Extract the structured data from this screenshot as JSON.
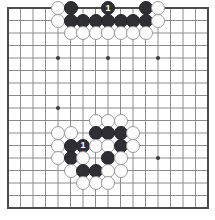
{
  "diagram": {
    "kind": "go-board-diagram",
    "board": {
      "size": 17,
      "lines": 17,
      "origin_x": 8,
      "origin_y": 8,
      "spacing": 12.5,
      "background_color": "#ffffff",
      "line_color": "#8c8c8c",
      "border_color": "#4a4a4a",
      "border_width": 2,
      "line_width": 1,
      "star_point_color": "#3a3a3a",
      "star_point_radius": 2,
      "star_points": [
        {
          "col": 4,
          "row": 4
        },
        {
          "col": 8,
          "row": 4
        },
        {
          "col": 12,
          "row": 4
        },
        {
          "col": 4,
          "row": 8
        },
        {
          "col": 12,
          "row": 12
        }
      ]
    },
    "stone_style": {
      "radius": 7,
      "black_fill": "#2f2f33",
      "black_edge": "#242427",
      "white_fill": "#fdfdfd",
      "white_edge": "#9a9a9a",
      "black_label_color": "#ffffff"
    },
    "stones": [
      {
        "col": 4,
        "row": 0,
        "color": "white",
        "label": ""
      },
      {
        "col": 5,
        "row": 0,
        "color": "black",
        "label": ""
      },
      {
        "col": 8,
        "row": 0,
        "color": "black",
        "label": "1"
      },
      {
        "col": 11,
        "row": 0,
        "color": "black",
        "label": ""
      },
      {
        "col": 12,
        "row": 0,
        "color": "white",
        "label": ""
      },
      {
        "col": 4,
        "row": 1,
        "color": "white",
        "label": ""
      },
      {
        "col": 5,
        "row": 1,
        "color": "black",
        "label": ""
      },
      {
        "col": 6,
        "row": 1,
        "color": "black",
        "label": ""
      },
      {
        "col": 7,
        "row": 1,
        "color": "black",
        "label": ""
      },
      {
        "col": 8,
        "row": 1,
        "color": "black",
        "label": ""
      },
      {
        "col": 9,
        "row": 1,
        "color": "black",
        "label": ""
      },
      {
        "col": 10,
        "row": 1,
        "color": "black",
        "label": ""
      },
      {
        "col": 11,
        "row": 1,
        "color": "black",
        "label": ""
      },
      {
        "col": 12,
        "row": 1,
        "color": "white",
        "label": ""
      },
      {
        "col": 5,
        "row": 2,
        "color": "white",
        "label": ""
      },
      {
        "col": 6,
        "row": 2,
        "color": "white",
        "label": ""
      },
      {
        "col": 7,
        "row": 2,
        "color": "white",
        "label": ""
      },
      {
        "col": 8,
        "row": 2,
        "color": "white",
        "label": ""
      },
      {
        "col": 9,
        "row": 2,
        "color": "white",
        "label": ""
      },
      {
        "col": 10,
        "row": 2,
        "color": "white",
        "label": ""
      },
      {
        "col": 11,
        "row": 2,
        "color": "white",
        "label": ""
      },
      {
        "col": 7,
        "row": 9,
        "color": "white",
        "label": ""
      },
      {
        "col": 8,
        "row": 9,
        "color": "white",
        "label": ""
      },
      {
        "col": 9,
        "row": 9,
        "color": "white",
        "label": ""
      },
      {
        "col": 4,
        "row": 10,
        "color": "white",
        "label": ""
      },
      {
        "col": 5,
        "row": 10,
        "color": "white",
        "label": ""
      },
      {
        "col": 7,
        "row": 10,
        "color": "black",
        "label": ""
      },
      {
        "col": 8,
        "row": 10,
        "color": "black",
        "label": ""
      },
      {
        "col": 9,
        "row": 10,
        "color": "black",
        "label": ""
      },
      {
        "col": 10,
        "row": 10,
        "color": "white",
        "label": ""
      },
      {
        "col": 4,
        "row": 11,
        "color": "white",
        "label": ""
      },
      {
        "col": 5,
        "row": 11,
        "color": "black",
        "label": ""
      },
      {
        "col": 6,
        "row": 11,
        "color": "black",
        "label": "1"
      },
      {
        "col": 7,
        "row": 11,
        "color": "white",
        "label": ""
      },
      {
        "col": 8,
        "row": 11,
        "color": "white",
        "label": ""
      },
      {
        "col": 9,
        "row": 11,
        "color": "black",
        "label": ""
      },
      {
        "col": 10,
        "row": 11,
        "color": "white",
        "label": ""
      },
      {
        "col": 4,
        "row": 12,
        "color": "white",
        "label": ""
      },
      {
        "col": 5,
        "row": 12,
        "color": "black",
        "label": ""
      },
      {
        "col": 6,
        "row": 12,
        "color": "white",
        "label": ""
      },
      {
        "col": 8,
        "row": 12,
        "color": "black",
        "label": ""
      },
      {
        "col": 9,
        "row": 12,
        "color": "white",
        "label": ""
      },
      {
        "col": 5,
        "row": 13,
        "color": "white",
        "label": ""
      },
      {
        "col": 6,
        "row": 13,
        "color": "black",
        "label": ""
      },
      {
        "col": 7,
        "row": 13,
        "color": "black",
        "label": ""
      },
      {
        "col": 8,
        "row": 13,
        "color": "white",
        "label": ""
      },
      {
        "col": 9,
        "row": 13,
        "color": "white",
        "label": ""
      },
      {
        "col": 6,
        "row": 14,
        "color": "white",
        "label": ""
      },
      {
        "col": 7,
        "row": 14,
        "color": "white",
        "label": ""
      },
      {
        "col": 8,
        "row": 14,
        "color": "white",
        "label": ""
      }
    ]
  }
}
